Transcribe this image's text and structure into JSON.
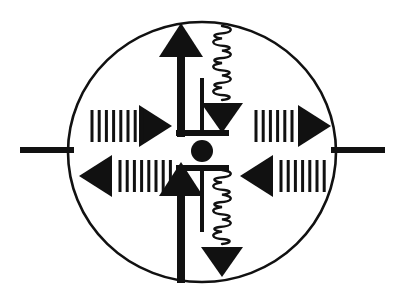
{
  "figure": {
    "title": "Carrier transport and recombination diagram",
    "type": "schematic-diagram",
    "canvas": {
      "width": 404,
      "height": 303,
      "background": "#ffffff"
    },
    "colors": {
      "stroke": "#111111",
      "fill": "#111111",
      "background": "#ffffff"
    }
  },
  "body_outline": {
    "name": "device-ellipse",
    "shape": "ellipse",
    "cx": 202,
    "cy": 152,
    "rx": 134,
    "ry": 130,
    "stroke_width": 2.6,
    "fill": "none"
  },
  "terminals": [
    {
      "name": "left-terminal-lead",
      "side": "left",
      "x1": 20,
      "y1": 150,
      "x2": 74,
      "y2": 150,
      "stroke_width": 6
    },
    {
      "name": "right-terminal-lead",
      "side": "right",
      "x1": 331,
      "y1": 150,
      "x2": 385,
      "y2": 150,
      "stroke_width": 6
    }
  ],
  "center_symbol": {
    "name": "capacitor-junction-symbol",
    "dot": {
      "cx": 202,
      "cy": 151,
      "r": 11
    },
    "plates": [
      {
        "name": "upper-plate-bar",
        "x1": 176,
        "y1": 133,
        "x2": 229,
        "y2": 133,
        "stroke_width": 6
      },
      {
        "name": "lower-plate-bar",
        "x1": 176,
        "y1": 168,
        "x2": 229,
        "y2": 168,
        "stroke_width": 6
      }
    ],
    "stems": [
      {
        "name": "upper-plate-stem",
        "x1": 202,
        "y1": 78,
        "x2": 202,
        "y2": 133,
        "stroke_width": 4
      },
      {
        "name": "lower-plate-stem",
        "x1": 202,
        "y1": 168,
        "x2": 202,
        "y2": 232,
        "stroke_width": 4
      }
    ]
  },
  "vertical_arrows": [
    {
      "name": "upper-vertical-arrow",
      "direction": "up",
      "shaft": {
        "x": 181,
        "y_start": 137,
        "y_end": 53,
        "width": 8
      },
      "head": {
        "cx": 181,
        "tip_y": 23,
        "base_y": 57,
        "half_width": 22
      }
    },
    {
      "name": "lower-vertical-arrow",
      "direction": "up",
      "shaft": {
        "x": 181,
        "y_start": 283,
        "y_end": 192,
        "width": 8
      },
      "head": {
        "cx": 181,
        "tip_y": 162,
        "base_y": 196,
        "half_width": 22
      }
    }
  ],
  "horizontal_arrows": [
    {
      "name": "upper-left-arrow",
      "quadrant": "upper-left",
      "direction": "right",
      "head": {
        "tip_x": 172,
        "base_x": 139,
        "cy": 126,
        "half_height": 21
      },
      "ticks": {
        "name": "upper-left-dash-train",
        "count": 8,
        "x_start": 92,
        "spacing": 7.2,
        "y_top": 110,
        "y_bottom": 142,
        "stroke_width": 3
      }
    },
    {
      "name": "lower-left-arrow",
      "quadrant": "lower-left",
      "direction": "left",
      "head": {
        "tip_x": 79,
        "base_x": 112,
        "cy": 176,
        "half_height": 21
      },
      "ticks": {
        "name": "lower-left-dash-train",
        "count": 8,
        "x_start": 120,
        "spacing": 7.2,
        "y_top": 160,
        "y_bottom": 192,
        "stroke_width": 3
      }
    },
    {
      "name": "upper-right-arrow",
      "quadrant": "upper-right",
      "direction": "right",
      "head": {
        "tip_x": 331,
        "base_x": 298,
        "cy": 126,
        "half_height": 21
      },
      "ticks": {
        "name": "upper-right-dash-train",
        "count": 6,
        "x_start": 256,
        "spacing": 7.2,
        "y_top": 110,
        "y_bottom": 142,
        "stroke_width": 3
      }
    },
    {
      "name": "lower-right-arrow",
      "quadrant": "lower-right",
      "direction": "left",
      "head": {
        "tip_x": 240,
        "base_x": 273,
        "cy": 176,
        "half_height": 21
      },
      "ticks": {
        "name": "lower-right-dash-train",
        "count": 7,
        "x_start": 281,
        "spacing": 7.2,
        "y_top": 160,
        "y_bottom": 192,
        "stroke_width": 3
      }
    }
  ],
  "photon_symbols": [
    {
      "name": "upper-photon-squiggle",
      "x": 222,
      "y_start": 26,
      "y_end": 100,
      "coil_count": 6,
      "amplitude": 5,
      "stroke_width": 2.4,
      "arrowhead": {
        "name": "upper-photon-arrowhead",
        "direction": "down",
        "cx": 222,
        "tip_y": 133,
        "base_y": 103,
        "half_width": 21
      }
    },
    {
      "name": "lower-photon-squiggle",
      "x": 222,
      "y_start": 170,
      "y_end": 244,
      "coil_count": 6,
      "amplitude": 5,
      "stroke_width": 2.4,
      "arrowhead": {
        "name": "lower-photon-arrowhead",
        "direction": "down",
        "cx": 222,
        "tip_y": 277,
        "base_y": 247,
        "half_width": 21
      }
    }
  ],
  "legend_notes": {
    "dash_train_meaning": "dashed tick train",
    "squiggle_meaning": "photon / radiative transition",
    "dot_meaning": "junction node"
  }
}
